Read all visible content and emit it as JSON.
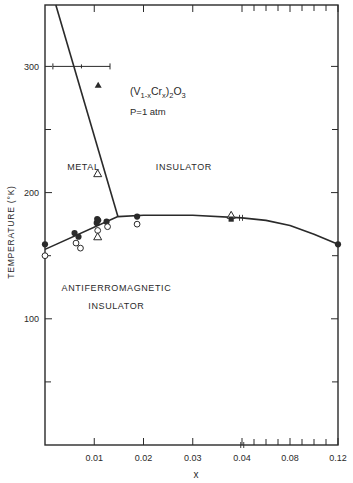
{
  "chart_data": {
    "type": "scatter",
    "formula": {
      "base": "(V",
      "sub1": "1-x",
      "mid": "Cr",
      "sub2": "x",
      "close": ")",
      "sub3": "2",
      "o": "O",
      "sub4": "3"
    },
    "pressure_label": "P=1 atm",
    "xlabel": "x",
    "ylabel": "TEMPERATURE (°K)",
    "ylim": [
      0,
      350
    ],
    "xlim": [
      0,
      0.12
    ],
    "x_ticks_labeled": [
      {
        "value": 0.01,
        "label": "0.01"
      },
      {
        "value": 0.02,
        "label": "0.02"
      },
      {
        "value": 0.03,
        "label": "0.03"
      },
      {
        "value": 0.04,
        "label": "0.04"
      },
      {
        "value": 0.08,
        "label": "0.08"
      },
      {
        "value": 0.12,
        "label": "0.12"
      }
    ],
    "x_minor_ticks": [
      0.05,
      0.06,
      0.07,
      0.09,
      0.1,
      0.11
    ],
    "y_ticks_labeled": [
      {
        "value": 100,
        "label": "100"
      },
      {
        "value": 200,
        "label": "200"
      },
      {
        "value": 300,
        "label": "300"
      }
    ],
    "y_minor_ticks": [
      50,
      150,
      250
    ],
    "region_labels": [
      {
        "text": "METAL",
        "x": 0.0045,
        "T": 218
      },
      {
        "text": "INSULATOR",
        "x": 0.0225,
        "T": 218
      },
      {
        "text": "ANTIFERROMAGNETIC",
        "x": 0.0145,
        "T": 122
      },
      {
        "text": "INSULATOR",
        "x": 0.0145,
        "T": 108
      }
    ],
    "phase_boundaries": [
      {
        "name": "metal-insulator",
        "points": [
          [
            0.0022,
            350
          ],
          [
            0.0148,
            181
          ]
        ]
      },
      {
        "name": "antiferromagnetic-boundary",
        "points": [
          [
            0.0,
            155
          ],
          [
            0.0148,
            181
          ],
          [
            0.02,
            182
          ],
          [
            0.03,
            182
          ],
          [
            0.04,
            180
          ],
          [
            0.06,
            178
          ],
          [
            0.08,
            174
          ],
          [
            0.1,
            167
          ],
          [
            0.12,
            159
          ]
        ]
      }
    ],
    "error_bar": {
      "T": 300,
      "x_min": 0.0016,
      "x_max": 0.0132,
      "x_center": 0.0074
    },
    "series": [
      {
        "name": "filled circles",
        "marker": "filled-circle",
        "points": [
          [
            0.0,
            159
          ],
          [
            0.006,
            168
          ],
          [
            0.0068,
            165
          ],
          [
            0.0105,
            176
          ],
          [
            0.0106,
            179
          ],
          [
            0.0108,
            178
          ],
          [
            0.0125,
            177
          ],
          [
            0.0187,
            181
          ],
          [
            0.12,
            159
          ]
        ]
      },
      {
        "name": "open circles",
        "marker": "open-circle",
        "points": [
          [
            0.0,
            150
          ],
          [
            0.0063,
            160
          ],
          [
            0.0072,
            156
          ],
          [
            0.0107,
            170
          ],
          [
            0.0127,
            173
          ],
          [
            0.0187,
            175
          ]
        ]
      },
      {
        "name": "open triangles",
        "marker": "open-triangle",
        "points": [
          [
            0.0107,
            215
          ],
          [
            0.0107,
            165
          ],
          [
            0.0378,
            182
          ]
        ]
      },
      {
        "name": "filled triangles",
        "marker": "filled-triangle",
        "points": [
          [
            0.0108,
            285
          ]
        ]
      },
      {
        "name": "filled squares",
        "marker": "filled-square",
        "points": [
          [
            0.0378,
            179
          ]
        ]
      },
      {
        "name": "split markers",
        "marker": "split-mark",
        "points": [
          [
            0.0398,
            180
          ],
          [
            0.0402,
            0
          ]
        ]
      }
    ]
  }
}
